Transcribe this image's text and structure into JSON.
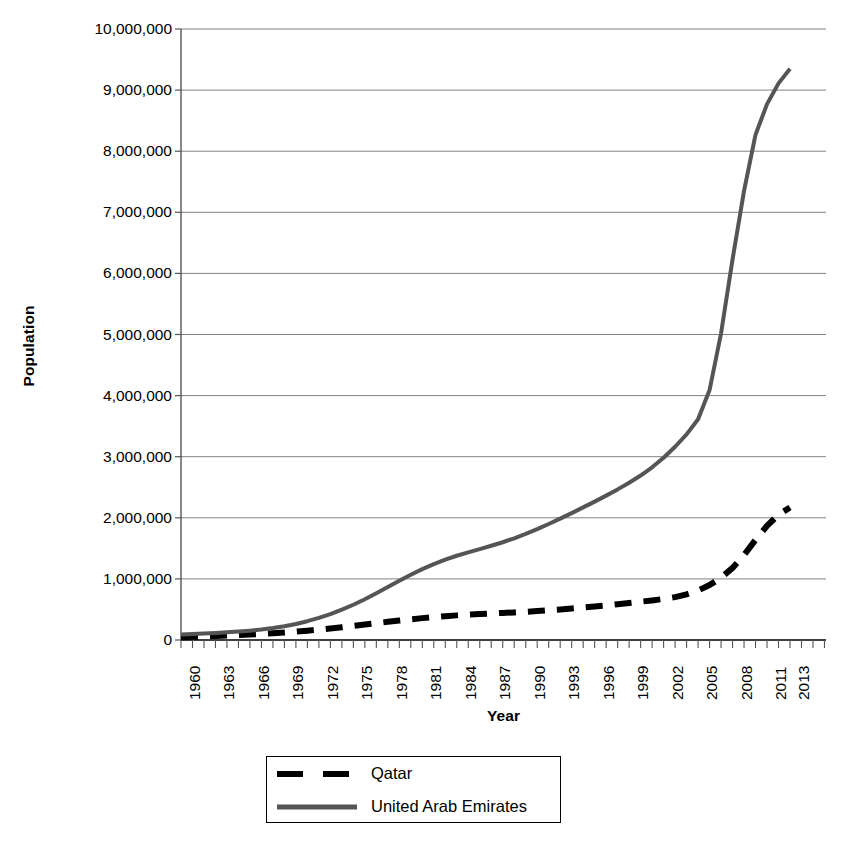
{
  "chart_data": {
    "type": "line",
    "title": "",
    "xlabel": "Year",
    "ylabel": "Population",
    "xlim": [
      1960,
      2013
    ],
    "ylim": [
      0,
      10000000
    ],
    "grid": true,
    "legend_position": "bottom",
    "y_ticks": [
      0,
      1000000,
      2000000,
      3000000,
      4000000,
      5000000,
      6000000,
      7000000,
      8000000,
      9000000,
      10000000
    ],
    "y_tick_labels": [
      "0",
      "1,000,000",
      "2,000,000",
      "3,000,000",
      "4,000,000",
      "5,000,000",
      "6,000,000",
      "7,000,000",
      "8,000,000",
      "9,000,000",
      "10,000,000"
    ],
    "x_tick_labels": [
      "1960",
      "1963",
      "1966",
      "1969",
      "1972",
      "1975",
      "1978",
      "1981",
      "1984",
      "1987",
      "1990",
      "1993",
      "1996",
      "1999",
      "2002",
      "2005",
      "2008",
      "2011",
      "2013"
    ],
    "x": [
      1960,
      1961,
      1962,
      1963,
      1964,
      1965,
      1966,
      1967,
      1968,
      1969,
      1970,
      1971,
      1972,
      1973,
      1974,
      1975,
      1976,
      1977,
      1978,
      1979,
      1980,
      1981,
      1982,
      1983,
      1984,
      1985,
      1986,
      1987,
      1988,
      1989,
      1990,
      1991,
      1992,
      1993,
      1994,
      1995,
      1996,
      1997,
      1998,
      1999,
      2000,
      2001,
      2002,
      2003,
      2004,
      2005,
      2006,
      2007,
      2008,
      2009,
      2010,
      2011,
      2012,
      2013
    ],
    "series": [
      {
        "name": "Qatar",
        "style": "dashed",
        "color": "#000000",
        "values": [
          47000,
          52000,
          58000,
          65000,
          72000,
          80000,
          89000,
          99000,
          110000,
          123000,
          137000,
          153000,
          170000,
          189000,
          209000,
          230000,
          252000,
          275000,
          297000,
          319000,
          339000,
          358000,
          375000,
          390000,
          403000,
          414000,
          424000,
          434000,
          443000,
          452000,
          462000,
          473000,
          486000,
          500000,
          516000,
          532000,
          549000,
          567000,
          586000,
          606000,
          627000,
          648000,
          672000,
          702000,
          746000,
          810000,
          899000,
          1020000,
          1180000,
          1390000,
          1640000,
          1870000,
          2050000,
          2170000
        ]
      },
      {
        "name": "United Arab Emirates",
        "style": "solid",
        "color": "#555555",
        "values": [
          92000,
          98000,
          106000,
          115000,
          125000,
          138000,
          153000,
          172000,
          196000,
          226000,
          263000,
          308000,
          361000,
          424000,
          496000,
          577000,
          667000,
          764000,
          866000,
          969000,
          1068000,
          1160000,
          1243000,
          1315000,
          1379000,
          1435000,
          1488000,
          1542000,
          1600000,
          1665000,
          1736000,
          1814000,
          1898000,
          1986000,
          2077000,
          2170000,
          2265000,
          2363000,
          2465000,
          2573000,
          2692000,
          2826000,
          2982000,
          3163000,
          3366000,
          3614000,
          4090000,
          5020000,
          6230000,
          7350000,
          8270000,
          8770000,
          9110000,
          9350000
        ]
      }
    ]
  },
  "axes": {
    "y_title": "Population",
    "x_title": "Year"
  },
  "legend": {
    "items": [
      {
        "label": "Qatar"
      },
      {
        "label": "United Arab Emirates"
      }
    ]
  }
}
